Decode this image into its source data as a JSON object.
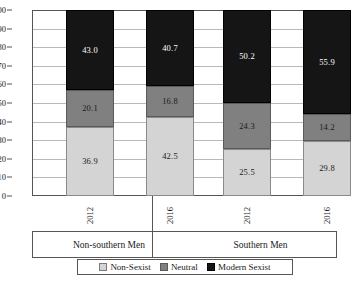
{
  "chart_data": {
    "type": "bar",
    "stacked": true,
    "title": "",
    "subtitle": "",
    "xlabel": "",
    "ylabel": "",
    "ylim": [
      0,
      100
    ],
    "yticks": [
      100,
      90,
      80,
      70,
      60,
      50,
      40,
      30,
      20,
      10,
      0
    ],
    "grid": true,
    "legend_position": "bottom",
    "categories": [
      "2012",
      "2016",
      "2012",
      "2016"
    ],
    "groups": [
      {
        "label": "Non-southern Men",
        "categories": [
          "2012",
          "2016"
        ]
      },
      {
        "label": "Southern Men",
        "categories": [
          "2012",
          "2016"
        ]
      }
    ],
    "series": [
      {
        "name": "Non-Sexist",
        "color": "#d4d4d4",
        "values": [
          36.9,
          42.5,
          25.5,
          29.8
        ]
      },
      {
        "name": "Neutral",
        "color": "#808080",
        "values": [
          20.1,
          16.8,
          24.3,
          14.2
        ]
      },
      {
        "name": "Modern Sexist",
        "color": "#151515",
        "values": [
          43.0,
          40.7,
          50.2,
          55.9
        ]
      }
    ],
    "bars": [
      {
        "group": "Non-southern Men",
        "year": "2012",
        "segments": [
          {
            "series": "Non-Sexist",
            "value": 36.9,
            "label": "36.9"
          },
          {
            "series": "Neutral",
            "value": 20.1,
            "label": "20.1"
          },
          {
            "series": "Modern Sexist",
            "value": 43.0,
            "label": "43.0"
          }
        ]
      },
      {
        "group": "Non-southern Men",
        "year": "2016",
        "segments": [
          {
            "series": "Non-Sexist",
            "value": 42.5,
            "label": "42.5"
          },
          {
            "series": "Neutral",
            "value": 16.8,
            "label": "16.8"
          },
          {
            "series": "Modern Sexist",
            "value": 40.7,
            "label": "40.7"
          }
        ]
      },
      {
        "group": "Southern Men",
        "year": "2012",
        "segments": [
          {
            "series": "Non-Sexist",
            "value": 25.5,
            "label": "25.5"
          },
          {
            "series": "Neutral",
            "value": 24.3,
            "label": "24.3"
          },
          {
            "series": "Modern Sexist",
            "value": 50.2,
            "label": "50.2"
          }
        ]
      },
      {
        "group": "Southern Men",
        "year": "2016",
        "segments": [
          {
            "series": "Non-Sexist",
            "value": 29.8,
            "label": "29.8"
          },
          {
            "series": "Neutral",
            "value": 14.2,
            "label": "14.2"
          },
          {
            "series": "Modern Sexist",
            "value": 55.9,
            "label": "55.9"
          }
        ]
      }
    ]
  },
  "axis": {
    "ytick_labels": [
      "100",
      "90",
      "80",
      "70",
      "60",
      "50",
      "40",
      "30",
      "20",
      "10",
      "0"
    ]
  },
  "legend": {
    "items": [
      {
        "label": "Non-Sexist",
        "swatch": "light-gray-swatch"
      },
      {
        "label": "Neutral",
        "swatch": "medium-gray-swatch"
      },
      {
        "label": "Modern Sexist",
        "swatch": "black-swatch"
      }
    ]
  }
}
